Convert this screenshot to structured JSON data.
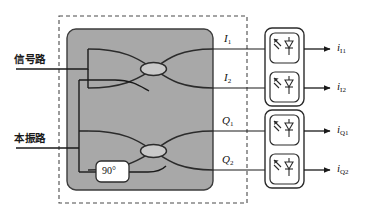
{
  "figure": {
    "colors": {
      "chip_fill": "#a8a8a8",
      "chip_stroke": "#3c3c3c",
      "dashed_border": "#4a4a4a",
      "waveguide": "#2b2b2b",
      "coupler_fill": "#c9c9c9",
      "box_fill": "#ffffff",
      "line": "#1a1a1a",
      "text": "#111111"
    }
  },
  "inputs": [
    {
      "id": "signal",
      "label": "信号路"
    },
    {
      "id": "lo",
      "label": "本振路"
    }
  ],
  "phase_shifter": {
    "label": "90°"
  },
  "hybrid_outputs": [
    {
      "id": "i1",
      "letter": "I",
      "sub": "1"
    },
    {
      "id": "i2",
      "letter": "I",
      "sub": "2"
    },
    {
      "id": "q1",
      "letter": "Q",
      "sub": "1"
    },
    {
      "id": "q2",
      "letter": "Q",
      "sub": "2"
    }
  ],
  "detector_currents": [
    {
      "id": "ii1",
      "letter": "i",
      "sub": "I1"
    },
    {
      "id": "ii2",
      "letter": "i",
      "sub": "I2"
    },
    {
      "id": "iq1",
      "letter": "i",
      "sub": "Q1"
    },
    {
      "id": "iq2",
      "letter": "i",
      "sub": "Q2"
    }
  ],
  "detector_groups": [
    {
      "id": "bpd-i",
      "name": "balanced-photodetector-pair-i"
    },
    {
      "id": "bpd-q",
      "name": "balanced-photodetector-pair-q"
    }
  ],
  "couplers": [
    {
      "id": "mmi-i",
      "name": "2x2-mmi-coupler-i"
    },
    {
      "id": "mmi-q",
      "name": "2x2-mmi-coupler-q"
    }
  ]
}
